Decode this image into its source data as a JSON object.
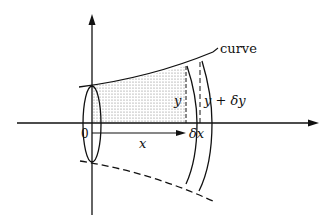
{
  "figure": {
    "labels": {
      "curve": "curve",
      "origin": "0",
      "x": "x",
      "delta_x": "δx",
      "y": "y",
      "y_plus_delta_y": "y + δy"
    },
    "colors": {
      "stroke": "#111111",
      "shading": "#9a9a9a",
      "background": "#ffffff"
    }
  }
}
